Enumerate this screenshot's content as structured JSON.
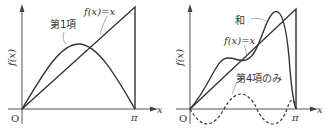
{
  "figures": [
    {
      "id": "left",
      "curves": [
        {
          "name": "f(x)=x",
          "label": "f(x)=x",
          "style": "solid"
        },
        {
          "name": "first-term",
          "label": "第1項",
          "style": "solid"
        }
      ],
      "axis": {
        "x_label": "x",
        "y_label": "f(x)",
        "origin_label": "O",
        "pi_label": "π"
      }
    },
    {
      "id": "right",
      "curves": [
        {
          "name": "sum",
          "label": "和",
          "style": "solid"
        },
        {
          "name": "f(x)=x",
          "label": "f(x)=x",
          "style": "solid"
        },
        {
          "name": "fourth-term-only",
          "label": "第4項のみ",
          "style": "dashed"
        }
      ],
      "axis": {
        "x_label": "x",
        "y_label": "f(x)",
        "origin_label": "O",
        "pi_label": "π"
      }
    }
  ],
  "labels": {
    "left_fx": "f(x)=x",
    "left_term1": "第1項",
    "left_y": "f(x)",
    "left_x": "x",
    "left_o": "O",
    "left_pi": "π",
    "right_sum": "和",
    "right_fx": "f(x)=x",
    "right_term4": "第4項のみ",
    "right_y": "f(x)",
    "right_x": "x",
    "right_o": "O",
    "right_pi": "π"
  },
  "colors": {
    "line": "#333333",
    "axis": "#555555",
    "background": "#ffffff"
  }
}
